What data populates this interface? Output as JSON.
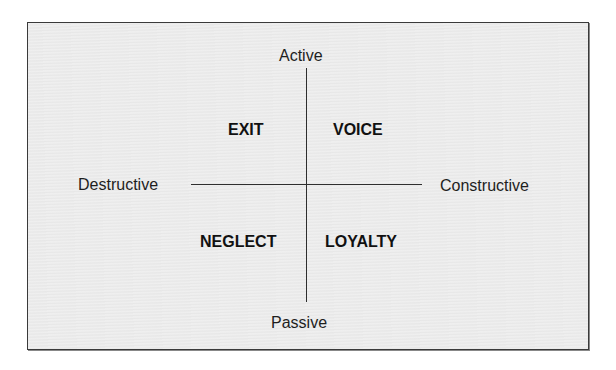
{
  "diagram": {
    "type": "quadrant",
    "axes": {
      "vertical": {
        "top": "Active",
        "bottom": "Passive"
      },
      "horizontal": {
        "left": "Destructive",
        "right": "Constructive"
      }
    },
    "quadrants": {
      "top_left": "EXIT",
      "top_right": "VOICE",
      "bottom_left": "NEGLECT",
      "bottom_right": "LOYALTY"
    },
    "colors": {
      "background": "#ebebeb",
      "line": "#2e2e2e",
      "text": "#1e1e1e"
    }
  }
}
